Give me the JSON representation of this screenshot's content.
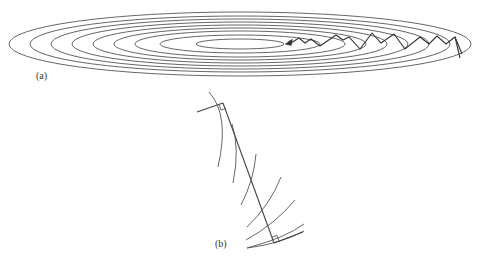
{
  "figure": {
    "panel_a": {
      "label": "(a)",
      "description": "Nested elongated elliptical contour lines with a zigzag steepest-descent path from the right edge toward the center",
      "contour_count": 8,
      "center": [
        240,
        44
      ],
      "line_color": "#555555",
      "path_color": "#333333"
    },
    "panel_b": {
      "label": "(b)",
      "description": "A straight search line crossing several curved contour arcs, with right-angle markers at both ends where the line meets the gradient directions",
      "line_color": "#444444"
    }
  }
}
